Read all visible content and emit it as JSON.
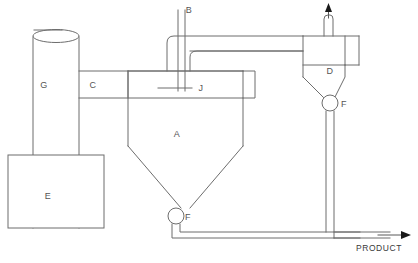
{
  "diagram": {
    "width": 418,
    "height": 263,
    "background_color": "#ffffff",
    "line_color": "#6d6d6d",
    "label_color": "#555555",
    "arrow_color": "#1a1a1a",
    "equipment": [
      {
        "tag": "A",
        "name": "fluidized-bed-vessel",
        "label_x": 175,
        "label_y": 134
      },
      {
        "tag": "B",
        "name": "feed-inlet-pipe",
        "label_x": 189,
        "label_y": 13
      },
      {
        "tag": "C",
        "name": "connecting-duct",
        "label_x": 93,
        "label_y": 88
      },
      {
        "tag": "D",
        "name": "cyclone-separator",
        "label_x": 330,
        "label_y": 71
      },
      {
        "tag": "E",
        "name": "base-tank",
        "label_x": 48,
        "label_y": 197
      },
      {
        "tag": "F",
        "name": "discharge-valve-vessel",
        "label_x": 184,
        "label_y": 222
      },
      {
        "tag": "F",
        "name": "discharge-valve-cyclone",
        "label_x": 341,
        "label_y": 107
      },
      {
        "tag": "G",
        "name": "riser-column",
        "label_x": 44,
        "label_y": 88
      },
      {
        "tag": "J",
        "name": "distributor-internal",
        "label_x": 199,
        "label_y": 88
      }
    ],
    "streams": [
      {
        "name": "product-outlet",
        "label": "PRODUCT",
        "label_x": 380,
        "label_y": 249,
        "direction": "right"
      },
      {
        "name": "gas-vent-outlet",
        "label": "",
        "direction": "up"
      }
    ]
  }
}
